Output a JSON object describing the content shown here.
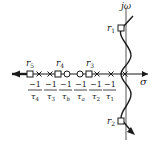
{
  "figure": {
    "type": "root-locus",
    "axes": {
      "real_label": "σ",
      "imag_label": "jω"
    },
    "roots": [
      {
        "id": "r1",
        "label": "r",
        "sub": "1",
        "x": 121,
        "y": 28
      },
      {
        "id": "r2",
        "label": "r",
        "sub": "2",
        "x": 121,
        "y": 121
      },
      {
        "id": "r3",
        "label": "r",
        "sub": "3",
        "x": 89,
        "y": 74
      },
      {
        "id": "r4",
        "label": "r",
        "sub": "4",
        "x": 58,
        "y": 74
      },
      {
        "id": "r5",
        "label": "r",
        "sub": "5",
        "x": 30,
        "y": 74
      }
    ],
    "poles_x": [
      39,
      50,
      97,
      111,
      125
    ],
    "zeros_x": [
      67,
      80
    ],
    "ticks": [
      {
        "num": "−1",
        "den": "τ",
        "sub": "4",
        "x": 39
      },
      {
        "num": "−1",
        "den": "τ",
        "sub": "3",
        "x": 50
      },
      {
        "num": "−1",
        "den": "τ",
        "sub": "b",
        "x": 61
      },
      {
        "num": "−1",
        "den": "τ",
        "sub": "a",
        "x": 80
      },
      {
        "num": "−1",
        "den": "τ",
        "sub": "2",
        "x": 95
      },
      {
        "num": "−1",
        "den": "τ",
        "sub": "1",
        "x": 108
      }
    ],
    "colors": {
      "ink": "#1a1a1a",
      "axis": "#555555"
    }
  }
}
